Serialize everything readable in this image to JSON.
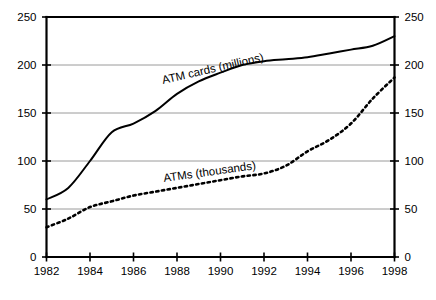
{
  "chart_data": {
    "type": "line",
    "title": "",
    "subtitle": "",
    "xlabel": "",
    "ylabel": "",
    "x": [
      1982,
      1983,
      1984,
      1985,
      1986,
      1987,
      1988,
      1989,
      1990,
      1991,
      1992,
      1993,
      1994,
      1995,
      1996,
      1997,
      1998
    ],
    "xlim": [
      1982,
      1998
    ],
    "ylim": [
      0,
      250
    ],
    "y_ticks": [
      0,
      50,
      100,
      150,
      200,
      250
    ],
    "x_ticks": [
      1982,
      1984,
      1986,
      1988,
      1990,
      1992,
      1994,
      1996,
      1998
    ],
    "x_tick_labels": [
      "1982",
      "1984",
      "1986",
      "1988",
      "1990",
      "1992",
      "1994",
      "1996",
      "1998"
    ],
    "y_tick_labels_left": [
      "0",
      "50",
      "100",
      "150",
      "200",
      "250"
    ],
    "y_tick_labels_right": [
      "0",
      "50",
      "100",
      "150",
      "200",
      "250"
    ],
    "grid": "horizontal",
    "grid_values": [
      50,
      100,
      150,
      200
    ],
    "legend_position": "inline-annotation",
    "dual_axis": true,
    "series": [
      {
        "name": "ATM cards (millions)",
        "style": "solid",
        "color": "#000000",
        "values": [
          60,
          72,
          100,
          130,
          139,
          152,
          170,
          183,
          192,
          200,
          204,
          206,
          208,
          212,
          216,
          220,
          230
        ]
      },
      {
        "name": "ATMs (thousands)",
        "style": "dotted",
        "color": "#000000",
        "values": [
          31,
          40,
          52,
          58,
          64,
          68,
          72,
          76,
          80,
          84,
          87,
          95,
          110,
          122,
          139,
          165,
          187
        ]
      }
    ],
    "annotations": [
      {
        "text": "ATM cards (millions)",
        "x": 163,
        "y": 84,
        "rotation": -13
      },
      {
        "text": "ATMs (thousands)",
        "x": 164,
        "y": 182,
        "rotation": -8
      }
    ]
  }
}
